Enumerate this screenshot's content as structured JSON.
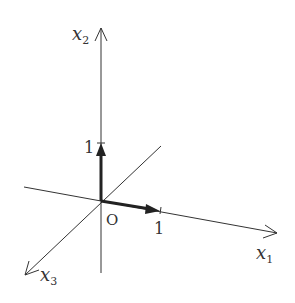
{
  "diagram": {
    "type": "3d-coordinate-axes",
    "axes": [
      {
        "name": "x1",
        "label": "x",
        "subscript": "1"
      },
      {
        "name": "x2",
        "label": "x",
        "subscript": "2"
      },
      {
        "name": "x3",
        "label": "x",
        "subscript": "3"
      }
    ],
    "origin_label": "O",
    "unit_vectors": [
      {
        "along": "x1",
        "tick_label": "1"
      },
      {
        "along": "x2",
        "tick_label": "1"
      }
    ],
    "colors": {
      "line": "#333333",
      "vector": "#222222",
      "background": "#ffffff"
    }
  }
}
